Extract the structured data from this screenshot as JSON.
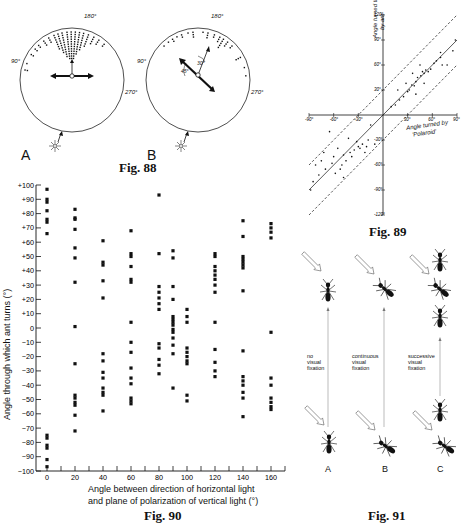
{
  "fig88": {
    "caption": "Fig. 88",
    "panelA": {
      "label": "A",
      "angle_top": "180°",
      "angle_left": "90°",
      "angle_right": "270°"
    },
    "panelB": {
      "label": "B",
      "angle_top": "180°",
      "angle_left": "90°",
      "angle_right": "270°",
      "angle_45": "45°",
      "angle_30": "30°"
    }
  },
  "fig89": {
    "caption": "Fig. 89",
    "ylabel_line1": "Angle turned through",
    "ylabel_line2": "by ant",
    "xlabel_line1": "Angle turned by",
    "xlabel_line2": "'Polaroid'",
    "x_ticks": [
      "-90°",
      "-60°",
      "-30°",
      "30°",
      "60°",
      "90°"
    ],
    "y_ticks": [
      "120°",
      "90°",
      "60°",
      "30°",
      "-30°",
      "-60°",
      "-90°",
      "-120°"
    ]
  },
  "fig90": {
    "caption": "Fig. 90",
    "ylabel": "Angle through which ant turns (°)",
    "xlabel_line1": "Angle between direction of  horizontal light",
    "xlabel_line2": "and plane of  polarization of vertical light (°)",
    "y_ticks": [
      "+100",
      "+90",
      "+80",
      "+70",
      "+60",
      "+50",
      "+40",
      "+30",
      "+20",
      "+10",
      "0",
      "-10",
      "-20",
      "-30",
      "-40",
      "-50",
      "-60",
      "-70",
      "-80",
      "-90",
      "-100"
    ],
    "x_ticks": [
      "0",
      "20",
      "40",
      "60",
      "80",
      "100",
      "120",
      "140",
      "160"
    ]
  },
  "fig91": {
    "caption": "Fig. 91",
    "panels": [
      {
        "label": "A",
        "text": [
          "no",
          "visual",
          "fixation"
        ]
      },
      {
        "label": "B",
        "text": [
          "continuous",
          "visual",
          "fixation"
        ]
      },
      {
        "label": "C",
        "text": [
          "successive",
          "visual",
          "fixation"
        ]
      }
    ]
  },
  "chart_data": [
    {
      "type": "scatter",
      "title": "Fig. 90",
      "xlabel": "Angle between direction of horizontal light and plane of polarization of vertical light (°)",
      "ylabel": "Angle through which ant turns (°)",
      "xlim": [
        0,
        170
      ],
      "ylim": [
        -100,
        100
      ],
      "x_ticks": [
        0,
        20,
        40,
        60,
        80,
        100,
        120,
        140,
        160
      ],
      "y_ticks": [
        -100,
        -90,
        -80,
        -70,
        -60,
        -50,
        -40,
        -30,
        -20,
        -10,
        0,
        10,
        20,
        30,
        40,
        50,
        60,
        70,
        80,
        90,
        100
      ],
      "grid": false,
      "columns": [
        {
          "x": 0,
          "y": [
            97,
            90,
            88,
            82,
            76,
            74,
            66,
            -75,
            -77,
            -82,
            -84,
            -92,
            -97
          ]
        },
        {
          "x": 20,
          "y": [
            83,
            77,
            76,
            69,
            56,
            49,
            32,
            1,
            -25,
            -47,
            -49,
            -52,
            -54,
            -61,
            -72
          ]
        },
        {
          "x": 40,
          "y": [
            61,
            46,
            44,
            33,
            21,
            -18,
            -23,
            -31,
            -35,
            -42,
            -45,
            -47,
            -58
          ]
        },
        {
          "x": 60,
          "y": [
            68,
            52,
            50,
            43,
            34,
            32,
            4,
            -10,
            -17,
            -28,
            -35,
            -39,
            -49,
            -51,
            -53
          ]
        },
        {
          "x": 80,
          "y": [
            93,
            52,
            29,
            25,
            21,
            17,
            13,
            -11,
            -14,
            -22,
            -26,
            -32
          ]
        },
        {
          "x": 90,
          "y": [
            54,
            49,
            29,
            20,
            8,
            6,
            4,
            2,
            -1,
            -3,
            -7,
            -12,
            -18,
            -42
          ]
        },
        {
          "x": 100,
          "y": [
            13,
            8,
            4,
            -14,
            -17,
            -20,
            -23,
            -25,
            -47,
            -51
          ]
        },
        {
          "x": 120,
          "y": [
            52,
            50,
            43,
            40,
            37,
            34,
            30,
            25,
            4,
            -15,
            -24,
            -30,
            -34
          ]
        },
        {
          "x": 140,
          "y": [
            75,
            64,
            50,
            48,
            46,
            44,
            42,
            26,
            -16,
            -34,
            -37,
            -40,
            -45,
            -49,
            -62
          ]
        },
        {
          "x": 160,
          "y": [
            73,
            70,
            67,
            63,
            -3,
            -35,
            -40,
            -49,
            -52,
            -55,
            -57
          ]
        }
      ]
    },
    {
      "type": "scatter",
      "title": "Fig. 89",
      "xlabel": "Angle turned by 'Polaroid'",
      "ylabel": "Angle turned through by ant",
      "xlim": [
        -90,
        90
      ],
      "ylim": [
        -120,
        120
      ],
      "x_ticks": [
        -90,
        -60,
        -30,
        30,
        60,
        90
      ],
      "y_ticks": [
        -120,
        -90,
        -60,
        -30,
        30,
        60,
        90,
        120
      ],
      "lines": [
        {
          "name": "identity",
          "style": "solid",
          "slope": 1,
          "intercept": 0
        },
        {
          "name": "upper bound",
          "style": "dashed",
          "slope": 1,
          "intercept": 30
        },
        {
          "name": "lower bound",
          "style": "dashed",
          "slope": 1,
          "intercept": -30
        }
      ],
      "points": [
        [
          88,
          90
        ],
        [
          85,
          77
        ],
        [
          70,
          75
        ],
        [
          70,
          69
        ],
        [
          62,
          62
        ],
        [
          58,
          55
        ],
        [
          55,
          52
        ],
        [
          52,
          54
        ],
        [
          50,
          50
        ],
        [
          48,
          52
        ],
        [
          46,
          47
        ],
        [
          42,
          45
        ],
        [
          40,
          40
        ],
        [
          38,
          35
        ],
        [
          35,
          36
        ],
        [
          32,
          30
        ],
        [
          30,
          28
        ],
        [
          28,
          38
        ],
        [
          25,
          22
        ],
        [
          20,
          18
        ],
        [
          18,
          30
        ],
        [
          15,
          12
        ],
        [
          10,
          10
        ],
        [
          72,
          60
        ],
        [
          78,
          60
        ],
        [
          65,
          65
        ],
        [
          45,
          60
        ],
        [
          36,
          50
        ],
        [
          40,
          25
        ],
        [
          50,
          38
        ],
        [
          -10,
          -35
        ],
        [
          -15,
          -12
        ],
        [
          -18,
          -30
        ],
        [
          -20,
          -38
        ],
        [
          -22,
          -45
        ],
        [
          -25,
          -35
        ],
        [
          -28,
          -40
        ],
        [
          -30,
          -38
        ],
        [
          -32,
          -32
        ],
        [
          -35,
          -42
        ],
        [
          -38,
          -50
        ],
        [
          -40,
          -45
        ],
        [
          -42,
          -28
        ],
        [
          -45,
          -55
        ],
        [
          -48,
          -48
        ],
        [
          -50,
          -60
        ],
        [
          -52,
          -65
        ],
        [
          -55,
          -40
        ],
        [
          -58,
          -70
        ],
        [
          -60,
          -50
        ],
        [
          -62,
          -58
        ],
        [
          -65,
          -20
        ],
        [
          -70,
          -65
        ],
        [
          -75,
          -55
        ],
        [
          -78,
          -72
        ],
        [
          -82,
          -60
        ],
        [
          -85,
          -80
        ],
        [
          -88,
          -90
        ],
        [
          -72,
          -45
        ],
        [
          -48,
          -75
        ]
      ]
    }
  ]
}
